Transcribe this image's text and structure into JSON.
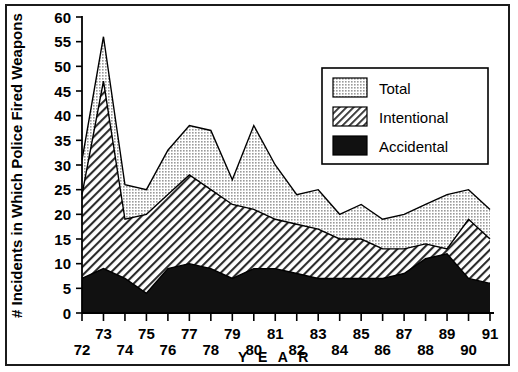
{
  "chart_data": {
    "type": "area",
    "stacked": true,
    "title": "",
    "xlabel": "Y E A R",
    "ylabel": "# Incidents in Which Police Fired Weapons",
    "categories": [
      "72",
      "73",
      "74",
      "75",
      "76",
      "77",
      "78",
      "79",
      "80",
      "81",
      "82",
      "83",
      "84",
      "85",
      "86",
      "87",
      "88",
      "89",
      "90",
      "91"
    ],
    "x_full_years": [
      1972,
      1973,
      1974,
      1975,
      1976,
      1977,
      1978,
      1979,
      1980,
      1981,
      1982,
      1983,
      1984,
      1985,
      1986,
      1987,
      1988,
      1989,
      1990,
      1991
    ],
    "xlim": [
      1972,
      1991
    ],
    "ylim": [
      0,
      60
    ],
    "y_ticks": [
      0,
      5,
      10,
      15,
      20,
      25,
      30,
      35,
      40,
      45,
      50,
      55,
      60
    ],
    "x_ticks": [
      72,
      73,
      74,
      75,
      76,
      77,
      78,
      79,
      80,
      81,
      82,
      83,
      84,
      85,
      86,
      87,
      88,
      89,
      90,
      91
    ],
    "grid": false,
    "legend_position": "top-right",
    "series": [
      {
        "name": "Total",
        "fill": "stipple",
        "color": "#d4d4d4",
        "values": [
          31,
          56,
          26,
          25,
          33,
          38,
          37,
          27,
          38,
          30,
          24,
          25,
          20,
          22,
          19,
          20,
          22,
          24,
          25,
          21
        ]
      },
      {
        "name": "Intentional",
        "fill": "hatch",
        "color": "#ffffff",
        "values": [
          24,
          47,
          19,
          20,
          24,
          28,
          25,
          22,
          21,
          19,
          18,
          17,
          15,
          15,
          13,
          13,
          14,
          13,
          19,
          15
        ]
      },
      {
        "name": "Accidental",
        "fill": "solid",
        "color": "#111111",
        "values": [
          7,
          9,
          7,
          4,
          9,
          10,
          9,
          7,
          9,
          9,
          8,
          7,
          7,
          7,
          7,
          8,
          11,
          12,
          7,
          6
        ]
      }
    ]
  },
  "legend": {
    "items": [
      {
        "label": "Total",
        "swatch": "stipple"
      },
      {
        "label": "Intentional",
        "swatch": "hatch"
      },
      {
        "label": "Accidental",
        "swatch": "solid"
      }
    ]
  },
  "colors": {
    "axis": "#000000",
    "frame": "#1b1b1b",
    "total_fill": "#d4d4d4",
    "intentional_fill": "#ffffff",
    "accidental_fill": "#111111",
    "background": "#ffffff"
  },
  "axes": {
    "y_title": "# Incidents in Which Police Fired Weapons",
    "x_title": "Y E A R",
    "y_tick_labels": [
      "0",
      "5",
      "10",
      "15",
      "20",
      "25",
      "30",
      "35",
      "40",
      "45",
      "50",
      "55",
      "60"
    ],
    "x_tick_labels": [
      "72",
      "73",
      "74",
      "75",
      "76",
      "77",
      "78",
      "79",
      "80",
      "81",
      "82",
      "83",
      "84",
      "85",
      "86",
      "87",
      "88",
      "89",
      "90",
      "91"
    ]
  }
}
